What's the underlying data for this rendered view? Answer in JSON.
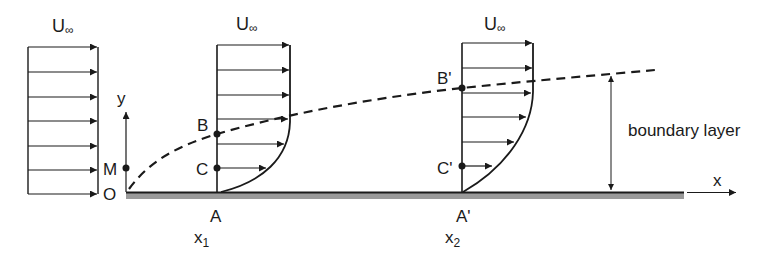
{
  "diagram": {
    "colors": {
      "line": "#1a1a1a",
      "plate_shade": "#9a9a9a",
      "background": "#ffffff"
    },
    "freestream_label": "U",
    "freestream_subscript": "∞",
    "axes": {
      "x_label": "x",
      "y_label": "y"
    },
    "points": {
      "origin": "O",
      "m": "M",
      "b": "B",
      "c": "C",
      "a": "A",
      "b_prime": "B'",
      "c_prime": "C'",
      "a_prime": "A'"
    },
    "stations": {
      "x1_main": "x",
      "x1_sub": "1",
      "x2_main": "x",
      "x2_sub": "2"
    },
    "boundary_layer_label": "boundary layer"
  }
}
